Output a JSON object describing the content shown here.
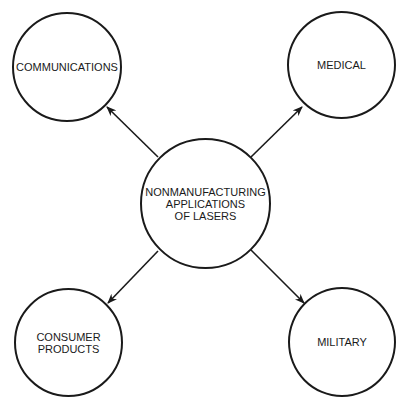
{
  "diagram": {
    "center": {
      "label": "NONMANUFACTURING\nAPPLICATIONS\nOF LASERS"
    },
    "nodes": [
      {
        "id": "communications",
        "label": "COMMUNICATIONS"
      },
      {
        "id": "medical",
        "label": "MEDICAL"
      },
      {
        "id": "consumer-products",
        "label": "CONSUMER\nPRODUCTS"
      },
      {
        "id": "military",
        "label": "MILITARY"
      }
    ],
    "edges": [
      {
        "from": "center",
        "to": "communications"
      },
      {
        "from": "center",
        "to": "medical"
      },
      {
        "from": "center",
        "to": "consumer-products"
      },
      {
        "from": "center",
        "to": "military"
      }
    ],
    "colors": {
      "stroke": "#1a1a1a",
      "background": "#ffffff"
    }
  }
}
